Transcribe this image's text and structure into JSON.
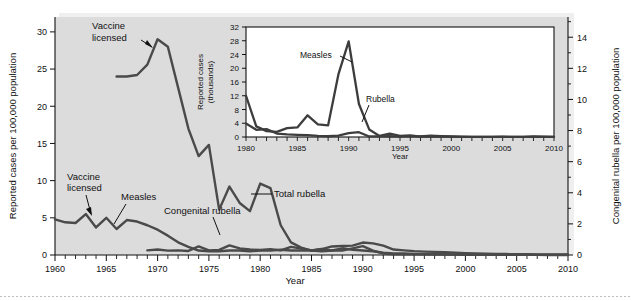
{
  "figure": {
    "title": "",
    "background_color": "#ffffff",
    "panel_color": "#dcdcdc",
    "line_color": "#4a4a4a"
  },
  "main_axes": {
    "xlabel": "Year",
    "ylabel_left": "Reported cases per 100,000 population",
    "ylabel_right": "Congenital rubella per 100,000 population",
    "xticklabels": [
      "1960",
      "1965",
      "1970",
      "1975",
      "1980",
      "1985",
      "1990",
      "1995",
      "2000",
      "2005",
      "2010"
    ],
    "yticklabels_left": [
      "0",
      "5",
      "10",
      "15",
      "20",
      "25",
      "30"
    ],
    "yticklabels_right": [
      "0",
      "2",
      "4",
      "6",
      "8",
      "10",
      "12",
      "14"
    ]
  },
  "annotations": {
    "vaccine_licensed_top": "Vaccine\nlicensed",
    "vaccine_licensed_top_line1": "Vaccine",
    "vaccine_licensed_top_line2": "licensed",
    "vaccine_licensed_bottom_line1": "Vaccine",
    "vaccine_licensed_bottom_line2": "licensed",
    "measles": "Measles",
    "congenital_rubella": "Congenital rubella",
    "total_rubella": "Total rubella"
  },
  "inset_axes": {
    "xlabel": "Year",
    "ylabel_line1": "Reported cases",
    "ylabel_line2": "(thousands)",
    "xticklabels": [
      "1980",
      "1985",
      "1990",
      "1995",
      "2000",
      "2005",
      "2010"
    ],
    "yticklabels": [
      "0",
      "4",
      "8",
      "12",
      "16",
      "20",
      "24",
      "28",
      "32"
    ],
    "annotation_measles": "Measles",
    "annotation_rubella": "Rubella"
  },
  "chart_data": [
    {
      "type": "line",
      "id": "main-chart",
      "title": "",
      "xlabel": "Year",
      "ylabel": "Reported cases per 100,000 population",
      "ylabel_secondary": "Congenital rubella per 100,000 population",
      "xlim": [
        1960,
        2010
      ],
      "ylim": [
        0,
        32
      ],
      "ylim_secondary": [
        0,
        15.3
      ],
      "grid": false,
      "legend": "inline-annotations",
      "series": [
        {
          "name": "Total rubella",
          "axis": "left",
          "x": [
            1966,
            1967,
            1968,
            1969,
            1970,
            1971,
            1972,
            1973,
            1974,
            1975,
            1976,
            1977,
            1978,
            1979,
            1980,
            1981,
            1982,
            1983,
            1984,
            1985,
            1986,
            1987,
            1988,
            1989,
            1990,
            1991,
            1992,
            1993,
            1994,
            1995,
            1996,
            1997,
            1998,
            1999,
            2000,
            2001,
            2002,
            2003,
            2004,
            2005,
            2006,
            2007,
            2008,
            2009,
            2010
          ],
          "y": [
            24.0,
            24.0,
            24.2,
            25.6,
            29.0,
            28.0,
            22.5,
            17.0,
            13.3,
            14.8,
            6.1,
            9.2,
            7.0,
            5.9,
            9.6,
            9.0,
            4.0,
            1.7,
            1.0,
            0.6,
            0.5,
            0.6,
            0.9,
            0.7,
            0.6,
            0.5,
            0.3,
            0.2,
            0.2,
            0.15,
            0.1,
            0.1,
            0.1,
            0.08,
            0.07,
            0.06,
            0.05,
            0.04,
            0.03,
            0.02,
            0.02,
            0.02,
            0.01,
            0.01,
            0.01
          ]
        },
        {
          "name": "Measles",
          "axis": "left",
          "x": [
            1960,
            1961,
            1962,
            1963,
            1964,
            1965,
            1966,
            1967,
            1968,
            1969,
            1970,
            1971,
            1972,
            1973,
            1974,
            1975,
            1976,
            1977,
            1978,
            1979,
            1980,
            1981,
            1982,
            1983,
            1984,
            1985,
            1986,
            1987,
            1988,
            1989,
            1990,
            1991,
            1992,
            1993,
            1994,
            1995,
            1996,
            1997,
            1998,
            1999,
            2000,
            2001,
            2002,
            2003,
            2004,
            2005,
            2006,
            2007,
            2008,
            2009,
            2010
          ],
          "y": [
            4.8,
            4.4,
            4.3,
            5.5,
            3.7,
            5.0,
            3.5,
            4.7,
            4.5,
            4.0,
            3.4,
            2.6,
            1.7,
            1.1,
            0.6,
            0.5,
            0.5,
            0.6,
            0.6,
            0.5,
            0.6,
            0.6,
            0.7,
            0.6,
            0.6,
            0.6,
            0.8,
            0.6,
            0.6,
            0.9,
            1.2,
            0.6,
            0.2,
            0.1,
            0.1,
            0.1,
            0.1,
            0.1,
            0.05,
            0.05,
            0.04,
            0.03,
            0.03,
            0.03,
            0.02,
            0.02,
            0.02,
            0.02,
            0.02,
            0.02,
            0.02
          ]
        },
        {
          "name": "Congenital rubella",
          "axis": "right",
          "x": [
            1969,
            1970,
            1971,
            1972,
            1973,
            1974,
            1975,
            1976,
            1977,
            1978,
            1979,
            1980,
            1981,
            1982,
            1983,
            1984,
            1985,
            1986,
            1987,
            1988,
            1989,
            1990,
            1991,
            1992,
            1993,
            1994,
            1995,
            1996,
            1997,
            1998,
            1999,
            2000,
            2001,
            2002,
            2003,
            2004,
            2005,
            2006,
            2007,
            2008,
            2009,
            2010
          ],
          "y": [
            0.3,
            0.35,
            0.28,
            0.3,
            0.26,
            0.55,
            0.3,
            0.33,
            0.62,
            0.42,
            0.35,
            0.32,
            0.38,
            0.3,
            0.52,
            0.42,
            0.3,
            0.38,
            0.55,
            0.58,
            0.6,
            0.8,
            0.75,
            0.6,
            0.35,
            0.3,
            0.25,
            0.22,
            0.2,
            0.18,
            0.15,
            0.12,
            0.1,
            0.08,
            0.07,
            0.06,
            0.05,
            0.05,
            0.04,
            0.04,
            0.04,
            0.04
          ]
        }
      ]
    },
    {
      "type": "line",
      "id": "inset-chart",
      "title": "",
      "xlabel": "Year",
      "ylabel": "Reported cases (thousands)",
      "xlim": [
        1980,
        2010
      ],
      "ylim": [
        0,
        32
      ],
      "grid": false,
      "legend": "inline-annotations",
      "series": [
        {
          "name": "Measles",
          "x": [
            1980,
            1981,
            1982,
            1983,
            1984,
            1985,
            1986,
            1987,
            1988,
            1989,
            1990,
            1991,
            1992,
            1993,
            1994,
            1995,
            1996,
            1997,
            1998,
            1999,
            2000,
            2001,
            2002,
            2003,
            2004,
            2005,
            2006,
            2007,
            2008,
            2009,
            2010
          ],
          "y": [
            12.0,
            3.1,
            1.7,
            1.5,
            2.6,
            2.8,
            6.3,
            3.7,
            3.4,
            18.2,
            27.8,
            9.6,
            2.2,
            0.3,
            1.0,
            0.3,
            0.5,
            0.14,
            0.1,
            0.1,
            0.09,
            0.12,
            0.04,
            0.06,
            0.04,
            0.07,
            0.06,
            0.04,
            0.14,
            0.07,
            0.06
          ]
        },
        {
          "name": "Rubella",
          "x": [
            1980,
            1981,
            1982,
            1983,
            1984,
            1985,
            1986,
            1987,
            1988,
            1989,
            1990,
            1991,
            1992,
            1993,
            1994,
            1995,
            1996,
            1997,
            1998,
            1999,
            2000,
            2001,
            2002,
            2003,
            2004,
            2005,
            2006,
            2007,
            2008,
            2009,
            2010
          ],
          "y": [
            3.9,
            2.1,
            2.3,
            1.0,
            0.75,
            0.63,
            0.55,
            0.31,
            0.22,
            0.4,
            1.13,
            1.4,
            0.16,
            0.19,
            0.23,
            0.13,
            0.24,
            0.18,
            0.36,
            0.27,
            0.18,
            0.02,
            0.02,
            0.01,
            0.01,
            0.01,
            0.01,
            0.01,
            0.01,
            0.01,
            0.01
          ]
        }
      ]
    }
  ]
}
